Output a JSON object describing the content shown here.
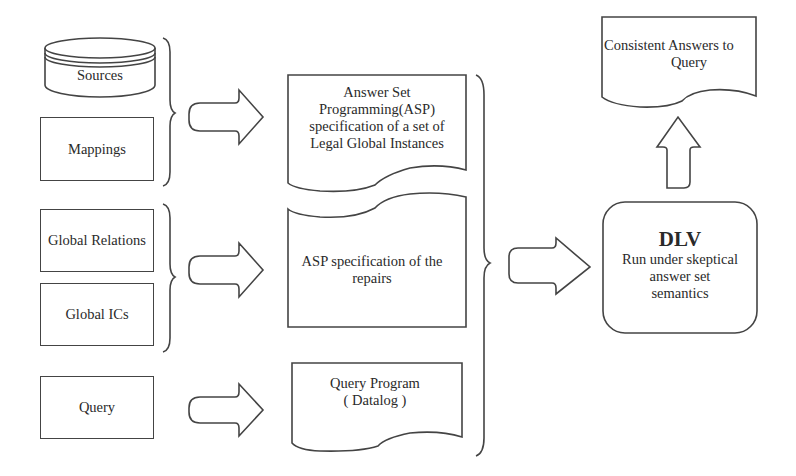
{
  "diagram": {
    "inputs": {
      "sources": "Sources",
      "mappings": "Mappings",
      "global_relations": "Global Relations",
      "global_ics": "Global ICs",
      "query": "Query"
    },
    "documents": {
      "asp_legal_instances": [
        "Answer Set",
        "Programming(ASP)",
        "specification of a set of",
        "Legal Global Instances"
      ],
      "asp_repairs": [
        "ASP specification of the",
        "repairs"
      ],
      "query_program": [
        "Query Program",
        "( Datalog )"
      ]
    },
    "solver": {
      "title": "DLV",
      "description": [
        "Run under skeptical",
        "answer set",
        "semantics"
      ]
    },
    "output": {
      "lines": [
        "Consistent Answers to",
        "Query"
      ]
    },
    "colors": {
      "stroke": "#444444",
      "background": "#ffffff",
      "text": "#2a2a2a"
    }
  }
}
